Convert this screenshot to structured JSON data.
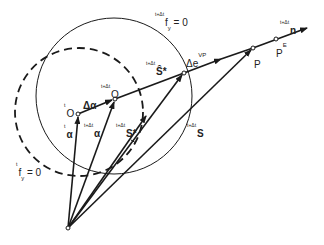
{
  "diagram": {
    "title": "",
    "colors": {
      "stroke": "#1a1a1a",
      "background": "#ffffff",
      "text": "#222222"
    },
    "points": {
      "origin": {
        "x": 68,
        "y": 228
      },
      "tO": {
        "x": 78,
        "y": 114
      },
      "tdtO": {
        "x": 115,
        "y": 99
      },
      "S_hat_star": {
        "x": 184,
        "y": 73
      },
      "P": {
        "x": 253,
        "y": 48
      },
      "PE": {
        "x": 276,
        "y": 38
      },
      "n_tip": {
        "x": 308,
        "y": 27
      },
      "S": {
        "x": 190,
        "y": 160
      },
      "S_star": {
        "x": 147,
        "y": 145
      }
    },
    "circles": [
      {
        "name": "yield-surface-t+dt",
        "style": "solid",
        "cx": 114,
        "cy": 96,
        "r": 78,
        "label": {
          "pre": "t+Δt",
          "main": "f",
          "sub": "y",
          "post": " = 0"
        }
      },
      {
        "name": "yield-surface-t",
        "style": "dashed",
        "cx": 79,
        "cy": 112,
        "r": 64,
        "label": {
          "pre": "t",
          "main": "f",
          "sub": "y",
          "post": " = 0"
        }
      }
    ],
    "labels": {
      "tO": {
        "pre": "t",
        "main": "O"
      },
      "tdtO": {
        "pre": "t+Δt",
        "main": "O"
      },
      "delta_alpha": {
        "main": "Δα"
      },
      "t_alpha": {
        "pre": "t",
        "main": "α"
      },
      "tdt_alpha": {
        "pre": "t+Δt",
        "main": "α"
      },
      "tdt_S_star": {
        "pre": "t+Δt",
        "main": "S*"
      },
      "tdt_S_hat_star": {
        "pre": "t+Δt",
        "main": "Ŝ*"
      },
      "delta_e_vp": {
        "main": "Δe",
        "sup": "VP"
      },
      "tdt_S": {
        "pre": "t+Δt",
        "main": "S"
      },
      "P": {
        "main": "P"
      },
      "PE": {
        "main": "P",
        "sup": "E"
      },
      "tdt_n": {
        "pre": "t+Δt",
        "main": "n"
      }
    }
  }
}
